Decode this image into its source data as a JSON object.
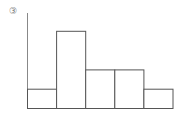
{
  "figure_label": "③",
  "chart_data": {
    "type": "bar",
    "title": "",
    "xlabel": "",
    "ylabel": "",
    "categories": [
      "1",
      "2",
      "3",
      "4",
      "5"
    ],
    "values": [
      1,
      4,
      2,
      2,
      1
    ],
    "grid": false,
    "bar_style": "outline",
    "stroke_color": "#555555",
    "fill_color": "#ffffff",
    "axis": {
      "y_axis_visible": true,
      "ticks_visible": false
    }
  }
}
